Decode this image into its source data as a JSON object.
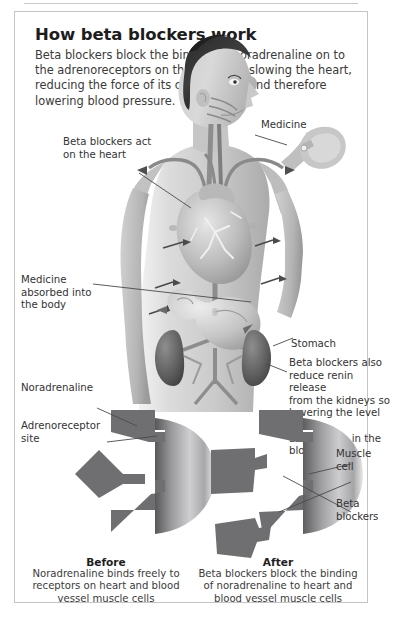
{
  "panel": {
    "title": "How beta blockers work",
    "intro": "Beta blockers block the binding of noradrenaline on to the adrenoreceptors on the heart, so slowing the heart, reducing the force of its contractions and therefore lowering blood pressure."
  },
  "body_diagram": {
    "labels": {
      "medicine": "Medicine",
      "heart_action": "Beta blockers act\non the heart",
      "absorbed": "Medicine\nabsorbed into\nthe body",
      "stomach": "Stomach",
      "kidney_note": "Beta blockers also\nreduce renin release\nfrom the kidneys so\nlowering the level of\nangiotensin in the\nblood."
    }
  },
  "receptor_diagram": {
    "labels": {
      "noradrenaline": "Noradrenaline",
      "adrenoreceptor_site": "Adrenoreceptor\nsite",
      "muscle_cell": "Muscle\ncell",
      "beta_blockers": "Beta\nblockers"
    },
    "before": {
      "title": "Before",
      "body": "Noradrenaline binds freely to receptors on heart and blood vessel muscle cells"
    },
    "after": {
      "title": "After",
      "body": "Beta blockers block the binding of noradrenaline to heart and blood vessel muscle cells"
    }
  },
  "colors": {
    "panel_border": "#c4c4c4",
    "title_text": "#1d1d1d",
    "body_text": "#3a3a3a",
    "skin_light": "#d8d8d8",
    "skin_mid": "#bdbdbd",
    "organ_dark": "#6f6f6f",
    "shape_dark": "#767676",
    "vessel": "#8a8a8a"
  }
}
